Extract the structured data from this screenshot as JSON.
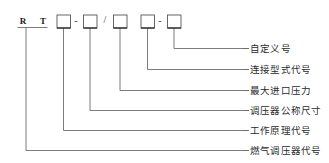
{
  "diagram": {
    "type": "model-designation-breakdown",
    "prefix_letters": [
      {
        "text": "R"
      },
      {
        "text": "T"
      }
    ],
    "separators": [
      {
        "glyph": "-",
        "name": "hyphen-separator-1"
      },
      {
        "glyph": "/",
        "name": "slash-separator"
      },
      {
        "glyph": "-",
        "name": "hyphen-separator-2"
      }
    ],
    "code_boxes": [
      {
        "name": "code-box-1",
        "value": ""
      },
      {
        "name": "code-box-2",
        "value": ""
      },
      {
        "name": "code-box-3",
        "value": ""
      },
      {
        "name": "code-box-4",
        "value": ""
      },
      {
        "name": "code-box-5",
        "value": ""
      }
    ],
    "labels": [
      {
        "text": "自定义号",
        "source": "code-box-5"
      },
      {
        "text": "连接型式代号",
        "source": "code-box-4"
      },
      {
        "text": "最大进口压力",
        "source": "code-box-3"
      },
      {
        "text": "调压器公称尺寸",
        "source": "code-box-2"
      },
      {
        "text": "工作原理代号",
        "source": "code-box-1"
      },
      {
        "text": "燃气调压器代号",
        "source": "prefix-letters"
      }
    ],
    "colors": {
      "line": "#6e6e6e",
      "box_stroke": "#555555",
      "text": "#2b2b2b",
      "letter": "#1a1a1a",
      "background": "#ffffff"
    }
  }
}
